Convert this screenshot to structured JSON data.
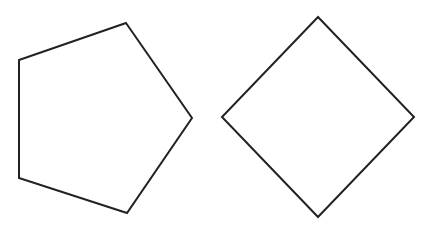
{
  "canvas": {
    "width": 437,
    "height": 234,
    "background": "#ffffff"
  },
  "stroke": {
    "color": "#222222",
    "width": 2
  },
  "shapes": [
    {
      "name": "pentagon",
      "sides": 5,
      "points": "126,23 192,118 127,213 19,178 19,60"
    },
    {
      "name": "diamond",
      "sides": 4,
      "points": "318,17 414,117 318,217 222,117"
    }
  ]
}
